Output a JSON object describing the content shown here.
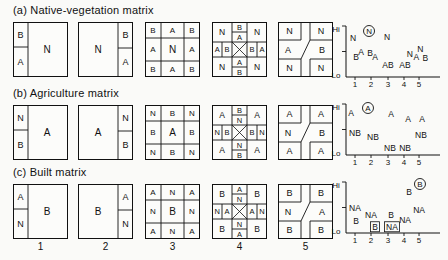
{
  "rows": [
    {
      "id": "a",
      "title": "(a) Native-vegetation matrix",
      "squares": [
        {
          "type": "split",
          "side": "left",
          "big": "N",
          "top": "B",
          "bottom": "A"
        },
        {
          "type": "split",
          "side": "right",
          "big": "N",
          "top": "B",
          "bottom": "A"
        },
        {
          "type": "ring",
          "center": "N",
          "edge": "A",
          "corner": "B"
        },
        {
          "type": "cross",
          "corner": "N",
          "v_outer": "B",
          "v_inner": "A",
          "h_outer": "A",
          "h_inner": "B"
        },
        {
          "type": "diag",
          "corner": "N",
          "left": "A",
          "right": "B"
        }
      ],
      "chart": {
        "label": "N",
        "label_pos": {
          "fx": 0.245,
          "fy": 0.92
        },
        "points": [
          {
            "t": "N",
            "fx": 0.074,
            "fy": 0.79
          },
          {
            "t": "B",
            "fx": 0.106,
            "fy": 0.4
          },
          {
            "t": "A",
            "fx": 0.16,
            "fy": 0.5
          },
          {
            "t": "B",
            "fx": 0.255,
            "fy": 0.48
          },
          {
            "t": "A",
            "fx": 0.309,
            "fy": 0.4
          },
          {
            "t": "N",
            "fx": 0.436,
            "fy": 0.81
          },
          {
            "t": "AB",
            "fx": 0.447,
            "fy": 0.25
          },
          {
            "t": "AB",
            "fx": 0.628,
            "fy": 0.24
          },
          {
            "t": "N",
            "fx": 0.678,
            "fy": 0.46
          },
          {
            "t": "A",
            "fx": 0.748,
            "fy": 0.41
          },
          {
            "t": "N",
            "fx": 0.79,
            "fy": 0.56
          },
          {
            "t": "B",
            "fx": 0.844,
            "fy": 0.39
          }
        ]
      }
    },
    {
      "id": "b",
      "title": "(b) Agriculture matrix",
      "squares": [
        {
          "type": "split",
          "side": "left",
          "big": "A",
          "top": "N",
          "bottom": "B"
        },
        {
          "type": "split",
          "side": "right",
          "big": "A",
          "top": "N",
          "bottom": "B"
        },
        {
          "type": "ring",
          "center": "A",
          "edge": "B",
          "corner": "N"
        },
        {
          "type": "cross",
          "corner": "A",
          "v_outer": "B",
          "v_inner": "N",
          "h_outer": "N",
          "h_inner": "B"
        },
        {
          "type": "diag",
          "corner": "A",
          "left": "N",
          "right": "B"
        }
      ],
      "chart": {
        "label": "A",
        "label_pos": {
          "fx": 0.234,
          "fy": 0.94
        },
        "points": [
          {
            "t": "A",
            "fx": 0.053,
            "fy": 0.84
          },
          {
            "t": "NB",
            "fx": 0.096,
            "fy": 0.44
          },
          {
            "t": "NB",
            "fx": 0.287,
            "fy": 0.36
          },
          {
            "t": "A",
            "fx": 0.479,
            "fy": 0.82
          },
          {
            "t": "NB",
            "fx": 0.468,
            "fy": 0.14
          },
          {
            "t": "A",
            "fx": 0.66,
            "fy": 0.72
          },
          {
            "t": "NB",
            "fx": 0.628,
            "fy": 0.14
          },
          {
            "t": "A",
            "fx": 0.809,
            "fy": 0.72
          },
          {
            "t": "NB",
            "fx": 0.798,
            "fy": 0.4
          }
        ]
      }
    },
    {
      "id": "c",
      "title": "(c) Built matrix",
      "squares": [
        {
          "type": "split",
          "side": "left",
          "big": "B",
          "top": "A",
          "bottom": "N"
        },
        {
          "type": "split",
          "side": "right",
          "big": "B",
          "top": "A",
          "bottom": "N"
        },
        {
          "type": "ring",
          "center": "B",
          "edge": "N",
          "corner": "A"
        },
        {
          "type": "cross",
          "corner": "B",
          "v_outer": "A",
          "v_inner": "N",
          "h_outer": "N",
          "h_inner": "A"
        },
        {
          "type": "diag",
          "corner": "B",
          "left": "N",
          "right": "A"
        }
      ],
      "chart": {
        "label": "B",
        "label_pos": {
          "fx": 0.787,
          "fy": 0.98
        },
        "points": [
          {
            "t": "NA",
            "fx": 0.096,
            "fy": 0.5
          },
          {
            "t": "B",
            "fx": 0.106,
            "fy": 0.25
          },
          {
            "t": "NA",
            "fx": 0.266,
            "fy": 0.354
          },
          {
            "t": "B",
            "fx": 0.309,
            "fy": 0.125,
            "boxed": true
          },
          {
            "t": "B",
            "fx": 0.479,
            "fy": 0.354
          },
          {
            "t": "NA",
            "fx": 0.489,
            "fy": 0.125,
            "boxed": true
          },
          {
            "t": "NA",
            "fx": 0.628,
            "fy": 0.27
          },
          {
            "t": "B",
            "fx": 0.67,
            "fy": 0.83
          },
          {
            "t": "NA",
            "fx": 0.777,
            "fy": 0.46
          }
        ]
      }
    }
  ],
  "axis": {
    "hi": "Hi",
    "lo": "Lo",
    "ticks": [
      "1",
      "2",
      "3",
      "4",
      "5"
    ]
  },
  "column_numbers": [
    "1",
    "2",
    "3",
    "4",
    "5"
  ],
  "chart_data": {
    "type": "scatter",
    "note": "Three Hi-Lo panels; letters N, A, B (and merged AB/NB/NA) plotted over configurations 1-5",
    "x_ticks": [
      1,
      2,
      3,
      4,
      5
    ],
    "ylabels": [
      "Lo",
      "Hi"
    ]
  }
}
